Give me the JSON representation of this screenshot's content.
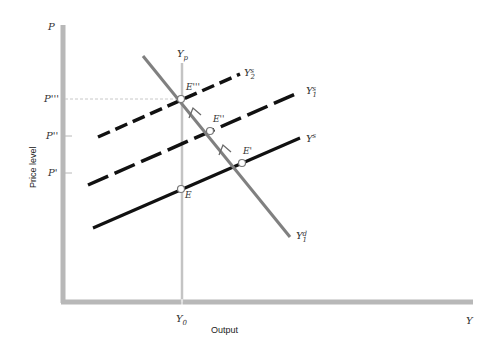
{
  "diagram": {
    "type": "economics-ad-as",
    "axes": {
      "y_axis_letter": "P",
      "x_axis_letter": "Y",
      "y_title": "Price level",
      "x_title": "Output",
      "color": "#b8b8b8"
    },
    "ticks": {
      "x": [
        {
          "label": "Y",
          "sub": "0"
        }
      ],
      "y": [
        {
          "label": "P'''",
          "y": 99
        },
        {
          "label": "P''",
          "y": 136
        },
        {
          "label": "P'",
          "y": 173
        }
      ]
    },
    "potential_output": {
      "label": "Y",
      "sub": "p"
    },
    "curves": {
      "aggregate_demand": {
        "label": "Y",
        "sup": "d",
        "sub": "1",
        "color": "#808080"
      },
      "supply_0": {
        "label": "Y",
        "sup": "s",
        "style": "solid",
        "color": "#111111"
      },
      "supply_1": {
        "label": "Y",
        "sup": "s",
        "sub": "1",
        "style": "dashed",
        "color": "#111111"
      },
      "supply_2": {
        "label": "Y",
        "sup": "s",
        "sub": "2",
        "style": "dashed",
        "color": "#111111"
      }
    },
    "points": [
      {
        "name": "E",
        "label": "E"
      },
      {
        "name": "E1",
        "label": "E'"
      },
      {
        "name": "E2",
        "label": "E''"
      },
      {
        "name": "E3",
        "label": "E'''"
      }
    ]
  }
}
